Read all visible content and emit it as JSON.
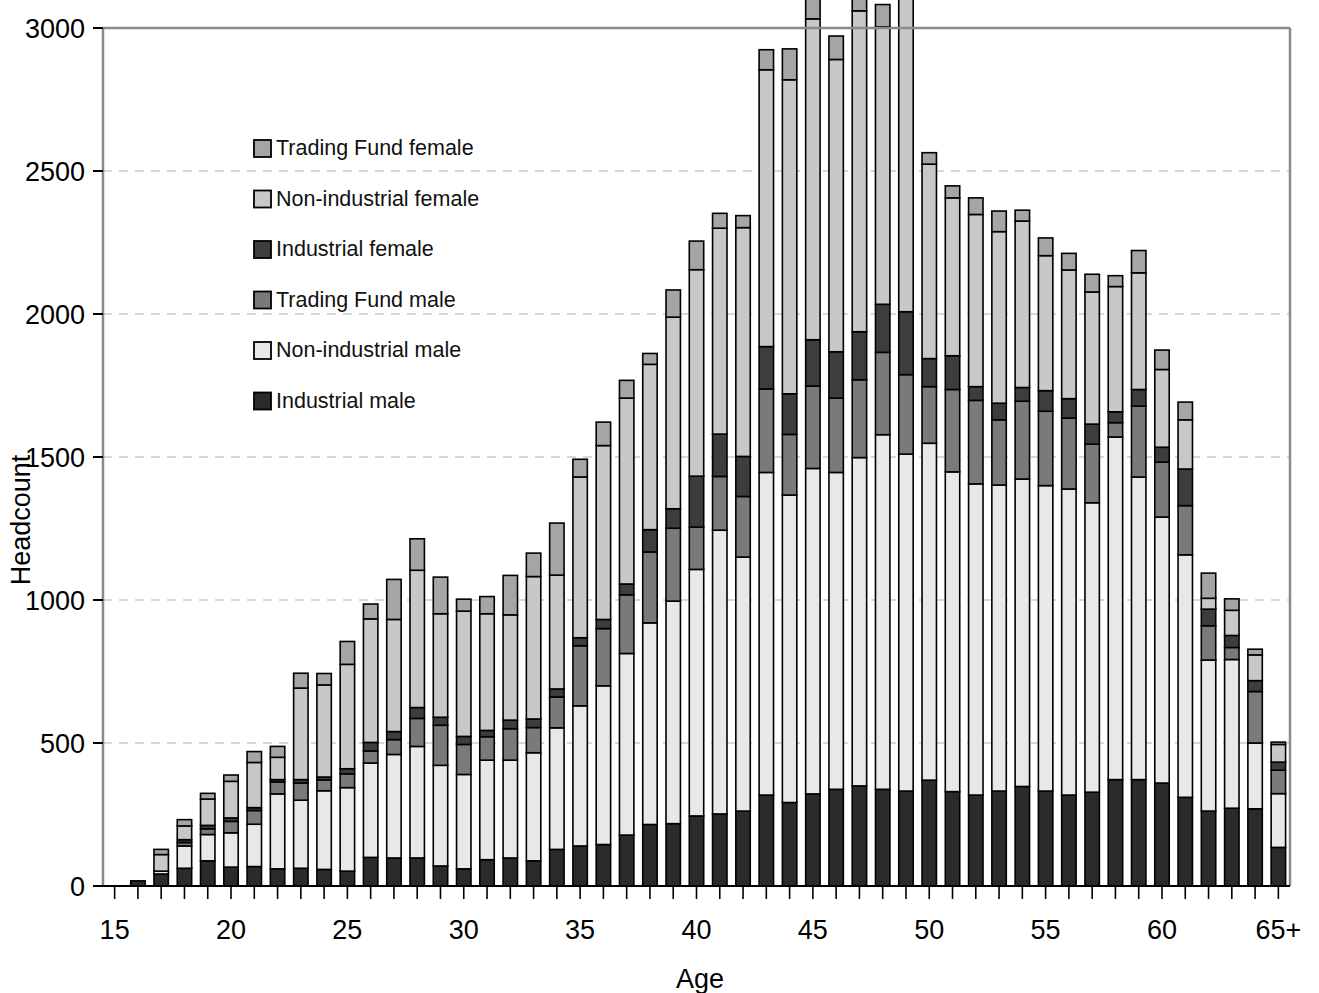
{
  "chart_data": {
    "type": "bar",
    "subtype": "stacked-vertical",
    "title": "",
    "xlabel": "Age",
    "ylabel": "Headcount",
    "ylim": [
      0,
      3000
    ],
    "ytick_step": 500,
    "yticks": [
      "0",
      "500",
      "1000",
      "1500",
      "2000",
      "2500",
      "3000"
    ],
    "grid": "horizontal-dashed",
    "legend_position": "inside-upper-left",
    "categories": [
      "15",
      "16",
      "17",
      "18",
      "19",
      "20",
      "21",
      "22",
      "23",
      "24",
      "25",
      "26",
      "27",
      "28",
      "29",
      "30",
      "31",
      "32",
      "33",
      "34",
      "35",
      "36",
      "37",
      "38",
      "39",
      "40",
      "41",
      "42",
      "43",
      "44",
      "45",
      "46",
      "47",
      "48",
      "49",
      "50",
      "51",
      "52",
      "53",
      "54",
      "55",
      "56",
      "57",
      "58",
      "59",
      "60",
      "61",
      "62",
      "63",
      "64",
      "65+"
    ],
    "xtick_labels": [
      "15",
      "20",
      "25",
      "30",
      "35",
      "40",
      "45",
      "50",
      "55",
      "60",
      "65+"
    ],
    "xtick_at_categories": [
      "15",
      "20",
      "25",
      "30",
      "35",
      "40",
      "45",
      "50",
      "55",
      "60",
      "65+"
    ],
    "series": [
      {
        "name": "Industrial male",
        "color": "#2b2b2b",
        "values": [
          0,
          18,
          42,
          62,
          88,
          66,
          68,
          60,
          62,
          58,
          52,
          100,
          98,
          98,
          70,
          60,
          92,
          98,
          88,
          128,
          140,
          145,
          178,
          215,
          218,
          245,
          252,
          262,
          318,
          292,
          322,
          338,
          350,
          338,
          332,
          370,
          330,
          318,
          332,
          348,
          332,
          318,
          328,
          372,
          372,
          360,
          310,
          262,
          272,
          270,
          135
        ]
      },
      {
        "name": "Non-industrial male",
        "color": "#e8e8e8",
        "values": [
          0,
          0,
          10,
          78,
          92,
          120,
          148,
          262,
          238,
          275,
          292,
          330,
          362,
          390,
          352,
          330,
          348,
          342,
          378,
          425,
          490,
          555,
          635,
          705,
          778,
          862,
          992,
          888,
          1128,
          1075,
          1138,
          1108,
          1148,
          1240,
          1178,
          1178,
          1118,
          1088,
          1070,
          1075,
          1068,
          1070,
          1012,
          1198,
          1058,
          930,
          848,
          528,
          520,
          230,
          188
        ]
      },
      {
        "name": "Trading Fund male",
        "color": "#7a7a7a",
        "values": [
          0,
          0,
          0,
          12,
          20,
          40,
          48,
          42,
          60,
          38,
          48,
          42,
          52,
          98,
          140,
          105,
          82,
          110,
          88,
          108,
          210,
          200,
          205,
          248,
          255,
          148,
          188,
          212,
          292,
          212,
          288,
          260,
          272,
          288,
          278,
          198,
          288,
          292,
          228,
          272,
          260,
          248,
          205,
          50,
          248,
          192,
          172,
          120,
          42,
          180,
          82
        ]
      },
      {
        "name": "Industrial female",
        "color": "#3d3d3d",
        "values": [
          0,
          0,
          0,
          10,
          12,
          12,
          10,
          8,
          12,
          10,
          18,
          30,
          28,
          38,
          28,
          28,
          22,
          30,
          30,
          28,
          28,
          32,
          38,
          78,
          68,
          178,
          148,
          140,
          148,
          142,
          162,
          162,
          168,
          168,
          220,
          98,
          118,
          48,
          58,
          48,
          72,
          68,
          70,
          38,
          58,
          52,
          128,
          58,
          42,
          38,
          28
        ]
      },
      {
        "name": "Non-industrial female",
        "color": "#c8c8c8",
        "values": [
          0,
          0,
          58,
          48,
          92,
          128,
          158,
          78,
          320,
          322,
          365,
          432,
          392,
          480,
          362,
          438,
          408,
          368,
          498,
          398,
          562,
          608,
          650,
          578,
          670,
          722,
          720,
          800,
          968,
          1098,
          1122,
          1022,
          1122,
          970,
          1122,
          680,
          552,
          602,
          600,
          582,
          472,
          450,
          462,
          438,
          408,
          272,
          172,
          38,
          88,
          90,
          62
        ]
      },
      {
        "name": "Trading Fund female",
        "color": "#a5a5a5",
        "values": [
          0,
          0,
          18,
          22,
          20,
          22,
          38,
          38,
          52,
          40,
          80,
          52,
          140,
          110,
          128,
          42,
          60,
          138,
          82,
          182,
          62,
          82,
          62,
          38,
          95,
          100,
          52,
          42,
          70,
          108,
          92,
          82,
          78,
          78,
          152,
          40,
          42,
          58,
          72,
          38,
          62,
          58,
          62,
          38,
          78,
          68,
          62,
          88,
          40,
          20,
          8
        ]
      }
    ]
  },
  "legend": {
    "items": [
      {
        "label": "Trading Fund female",
        "color": "#a5a5a5"
      },
      {
        "label": "Non-industrial female",
        "color": "#c8c8c8"
      },
      {
        "label": "Industrial female",
        "color": "#3d3d3d"
      },
      {
        "label": "Trading Fund male",
        "color": "#7a7a7a"
      },
      {
        "label": "Non-industrial male",
        "color": "#e8e8e8"
      },
      {
        "label": "Industrial male",
        "color": "#2b2b2b"
      }
    ]
  },
  "axes": {
    "y_title": "Headcount",
    "x_title": "Age"
  },
  "style": {
    "axis_color": "#8a8a8a",
    "bar_stroke": "#000000",
    "grid_color": "#cccccc"
  }
}
